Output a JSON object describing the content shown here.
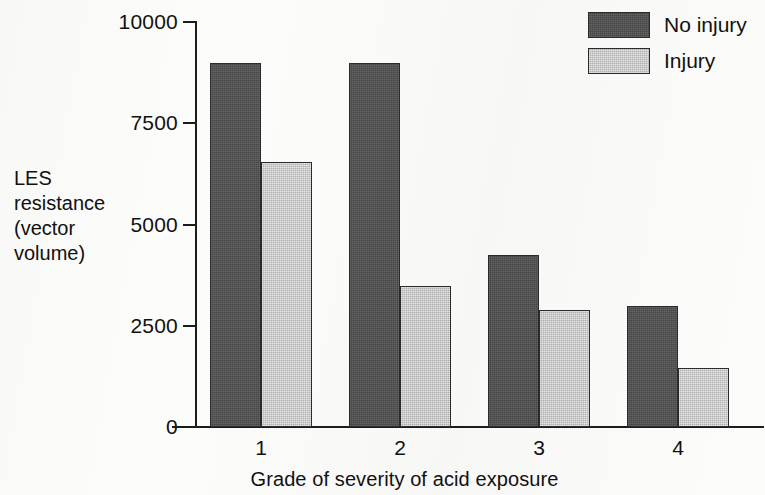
{
  "chart_data": {
    "type": "bar",
    "title": "",
    "xlabel": "Grade of severity of acid exposure",
    "ylabel": "LES resistance (vector volume)",
    "ylabel_lines": [
      "LES",
      "resistance",
      "(vector",
      "volume)"
    ],
    "categories": [
      "1",
      "2",
      "3",
      "4"
    ],
    "series": [
      {
        "name": "No injury",
        "color": "#4f4f4f",
        "values": [
          9000,
          9000,
          4250,
          3000
        ]
      },
      {
        "name": "Injury",
        "color": "#c6c6c6",
        "values": [
          6550,
          3480,
          2880,
          1450
        ]
      }
    ],
    "ylim": [
      0,
      10000
    ],
    "yticks": [
      0,
      2500,
      5000,
      7500,
      10000
    ],
    "ytick_labels": [
      "0",
      "2500",
      "5000",
      "7500",
      "10000"
    ],
    "grid": false,
    "legend_position": "top-right"
  },
  "legend": {
    "items": [
      {
        "label": "No injury",
        "color": "#4f4f4f"
      },
      {
        "label": "Injury",
        "color": "#c6c6c6"
      }
    ]
  },
  "axes": {
    "y_title_line1": "LES",
    "y_title_line2": "resistance",
    "y_title_line3": "(vector",
    "y_title_line4": "volume)",
    "x_title": "Grade of severity of acid exposure",
    "ytick_0": "0",
    "ytick_1": "2500",
    "ytick_2": "5000",
    "ytick_3": "7500",
    "ytick_4": "10000",
    "xtick_0": "1",
    "xtick_1": "2",
    "xtick_2": "3",
    "xtick_3": "4"
  }
}
